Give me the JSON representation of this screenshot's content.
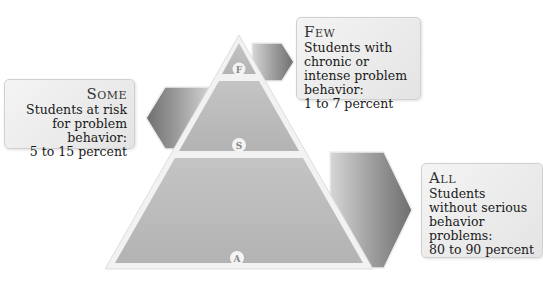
{
  "tiers": [
    {
      "key": "few",
      "badge": "F",
      "title": "Few",
      "description": "Students with chronic or intense problem behavior:",
      "percent": "1 to 7 percent"
    },
    {
      "key": "some",
      "badge": "S",
      "title": "Some",
      "description": "Students at risk for problem behavior:",
      "percent": "5 to 15 percent"
    },
    {
      "key": "all",
      "badge": "A",
      "title": "All",
      "description": "Students without serious behavior problems:",
      "percent": "80 to 90 percent"
    }
  ],
  "colors": {
    "tier_fill": "#b9b9b9",
    "tier_border": "#f5f5f5",
    "arrow_dark": "#7a7a7a",
    "arrow_light": "#d8d8d8",
    "callout_bg": "#ececec"
  }
}
